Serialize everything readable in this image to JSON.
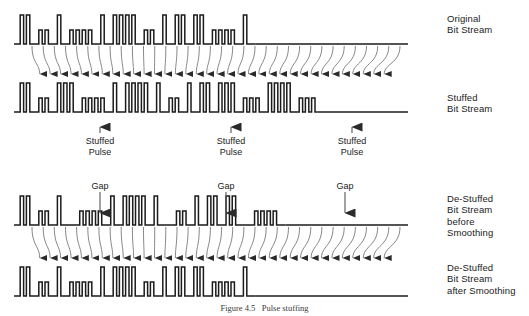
{
  "figure": {
    "caption": "Figure 4.5   Pulse stuffing",
    "background_color": "#ffffff",
    "trace_color": "#1b1b1b",
    "arrow_color": "#555555"
  },
  "waveforms": [
    {
      "id": "original",
      "label_lines": [
        "Original",
        "Bit Stream"
      ],
      "label_x": 447,
      "label_y": 13,
      "baseline_y": 44,
      "top_y": 15,
      "mid_y": 30,
      "start_x": 14,
      "end_x": 408,
      "bit_width": 6.2,
      "description": "Original bit stream, mixture of wide (data) and narrow (clock) pulses",
      "pattern": "0 T T 0 s s 0 T 0 s s s s 0 T 0 T T T T 0 s s 0 T 0 T T 0 T T 0 s s s s 0 T 0"
    },
    {
      "id": "stuffed",
      "label_lines": [
        "Stuffed",
        "Bit Stream"
      ],
      "label_x": 447,
      "label_y": 92,
      "baseline_y": 112,
      "top_y": 83,
      "mid_y": 98,
      "start_x": 14,
      "end_x": 408,
      "bit_width": 6.2,
      "description": "Bit stream after pulse stuffing: three extra stuffed pulses inserted"
    },
    {
      "id": "destuffed_before",
      "label_lines": [
        "De-Stuffed",
        "Bit Stream",
        "before",
        "Smoothing"
      ],
      "label_x": 447,
      "label_y": 193,
      "baseline_y": 225,
      "top_y": 196,
      "mid_y": 211,
      "start_x": 14,
      "end_x": 408,
      "bit_width": 6.2,
      "description": "De-stuffed stream showing gaps where the stuffed pulses were removed"
    },
    {
      "id": "destuffed_after",
      "label_lines": [
        "De-Stuffed",
        "Bit Stream",
        "after Smoothing"
      ],
      "label_x": 447,
      "label_y": 262,
      "baseline_y": 296,
      "top_y": 267,
      "mid_y": 282,
      "start_x": 14,
      "end_x": 408,
      "bit_width": 6.2,
      "description": "De-stuffed stream after smoothing, gaps removed, equals original"
    }
  ],
  "annotations": {
    "stuffed_pulse": {
      "text_lines": [
        "Stuffed",
        "Pulse"
      ],
      "arrow_direction": "up",
      "instances": [
        {
          "x": 100,
          "text_y": 136,
          "arrow_top_y": 117,
          "arrow_bottom_y": 133
        },
        {
          "x": 231,
          "text_y": 136,
          "arrow_top_y": 117,
          "arrow_bottom_y": 133
        },
        {
          "x": 352,
          "text_y": 136,
          "arrow_top_y": 117,
          "arrow_bottom_y": 133
        }
      ]
    },
    "gap": {
      "text_lines": [
        "Gap"
      ],
      "arrow_direction": "down",
      "instances": [
        {
          "x": 100,
          "text_y": 181,
          "arrow_top_y": 192,
          "arrow_bottom_y": 223
        },
        {
          "x": 226,
          "text_y": 181,
          "arrow_top_y": 192,
          "arrow_bottom_y": 223
        },
        {
          "x": 345,
          "text_y": 181,
          "arrow_top_y": 192,
          "arrow_bottom_y": 223
        }
      ]
    }
  },
  "mapping_arrows": {
    "top_group": {
      "from_y": 46,
      "to_y": 81,
      "count": 34,
      "description": "Arrows mapping original bits down onto the stuffed bit stream"
    },
    "bottom_group": {
      "from_y": 227,
      "to_y": 265,
      "count": 34,
      "description": "Arrows mapping de-stuffed bits down onto the smoothed bit stream"
    }
  },
  "chart_data": {
    "type": "line",
    "xlabel": "",
    "ylabel": "",
    "series": [
      {
        "name": "Original Bit Stream",
        "bits": [
          "L",
          "H",
          "H",
          "L",
          "M",
          "M",
          "L",
          "H",
          "L",
          "M",
          "M",
          "M",
          "M",
          "L",
          "H",
          "L",
          "H",
          "H",
          "H",
          "H",
          "L",
          "M",
          "M",
          "L",
          "H",
          "L",
          "H",
          "H",
          "L",
          "H",
          "H",
          "L",
          "M",
          "M",
          "M",
          "M",
          "L",
          "H",
          "L"
        ]
      },
      {
        "name": "Stuffed Bit Stream",
        "bits": [
          "L",
          "H",
          "H",
          "L",
          "M",
          "M",
          "L",
          "H",
          "S",
          "H",
          "L",
          "M",
          "M",
          "M",
          "M",
          "L",
          "H",
          "L",
          "H",
          "H",
          "H",
          "H",
          "L",
          "H",
          "L",
          "M",
          "M",
          "L",
          "H",
          "L",
          "H",
          "H",
          "L",
          "H",
          "S",
          "H",
          "L",
          "M",
          "M",
          "M",
          "L",
          "H",
          "H",
          "S",
          "H",
          "L",
          "M",
          "M",
          "M"
        ]
      },
      {
        "name": "De-Stuffed Bit Stream before Smoothing",
        "bits": [
          "L",
          "H",
          "H",
          "L",
          "M",
          "M",
          "L",
          "H",
          "G",
          "L",
          "M",
          "M",
          "M",
          "M",
          "L",
          "H",
          "L",
          "H",
          "H",
          "H",
          "H",
          "L",
          "H",
          "G",
          "L",
          "M",
          "M",
          "L",
          "H",
          "L",
          "H",
          "H",
          "L",
          "H",
          "H",
          "G",
          "L",
          "M",
          "M",
          "M",
          "M",
          "L"
        ]
      },
      {
        "name": "De-Stuffed Bit Stream after Smoothing",
        "bits": [
          "L",
          "H",
          "H",
          "L",
          "M",
          "M",
          "L",
          "H",
          "L",
          "M",
          "M",
          "M",
          "M",
          "L",
          "H",
          "L",
          "H",
          "H",
          "H",
          "H",
          "L",
          "M",
          "M",
          "L",
          "H",
          "L",
          "H",
          "H",
          "L",
          "H",
          "H",
          "L",
          "M",
          "M",
          "M",
          "M",
          "L",
          "H",
          "L"
        ]
      }
    ],
    "level_legend": {
      "L": "low / baseline",
      "H": "tall pulse",
      "M": "short pulse",
      "S": "stuffed pulse (inserted)",
      "G": "gap (pulse removed)"
    },
    "grid": false,
    "legend_position": "right"
  }
}
